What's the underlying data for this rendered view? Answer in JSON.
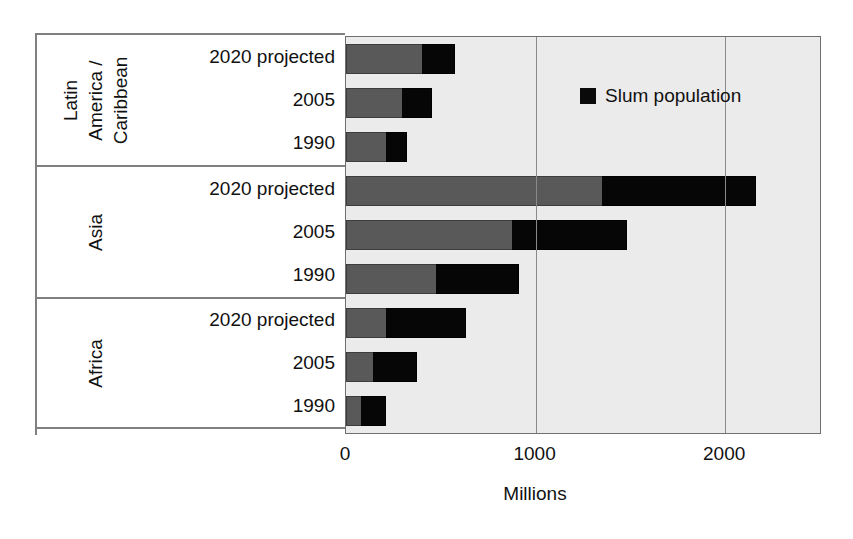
{
  "chart_data": {
    "type": "bar",
    "orientation": "horizontal",
    "stacked": true,
    "title": "",
    "xlabel": "Millions",
    "ylabel": "",
    "xlim": [
      0,
      2500
    ],
    "xticks": [
      0,
      1000,
      2000
    ],
    "xtick_labels": [
      "0",
      "1000",
      "2000"
    ],
    "grid": true,
    "legend": {
      "position": "inside-top-right",
      "entries": [
        {
          "label": "Slum population",
          "color": "#0a0a0a"
        }
      ]
    },
    "series": [
      {
        "name": "Non-slum urban population",
        "color": "#595959",
        "shown_in_legend": false
      },
      {
        "name": "Slum population",
        "color": "#0a0a0a",
        "shown_in_legend": true
      }
    ],
    "groups": [
      {
        "name": "Latin America / Caribbean",
        "name_lines": [
          "Latin",
          "America /",
          "Caribbean"
        ],
        "rows": [
          {
            "category": "2020 projected",
            "non_slum": 400,
            "slum": 175,
            "total": 575
          },
          {
            "category": "2005",
            "non_slum": 295,
            "slum": 160,
            "total": 455
          },
          {
            "category": "1990",
            "non_slum": 210,
            "slum": 110,
            "total": 320
          }
        ]
      },
      {
        "name": "Asia",
        "name_lines": [
          "Asia"
        ],
        "rows": [
          {
            "category": "2020 projected",
            "non_slum": 1350,
            "slum": 810,
            "total": 2160
          },
          {
            "category": "2005",
            "non_slum": 875,
            "slum": 605,
            "total": 1480
          },
          {
            "category": "1990",
            "non_slum": 475,
            "slum": 435,
            "total": 910
          }
        ]
      },
      {
        "name": "Africa",
        "name_lines": [
          "Africa"
        ],
        "rows": [
          {
            "category": "2020 projected",
            "non_slum": 210,
            "slum": 425,
            "total": 635
          },
          {
            "category": "2005",
            "non_slum": 140,
            "slum": 235,
            "total": 375
          },
          {
            "category": "1990",
            "non_slum": 80,
            "slum": 130,
            "total": 210
          }
        ]
      }
    ]
  }
}
